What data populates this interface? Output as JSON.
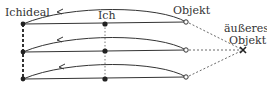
{
  "diagram": {
    "labels": {
      "ego_ideal": "Ichideal",
      "ego": "Ich",
      "object": "Objekt",
      "external_object_line1": "äußeres",
      "external_object_line2": "Objekt"
    },
    "rows": [
      {
        "ego_ideal_y": 24,
        "ego_y": 24,
        "object_y": 22
      },
      {
        "ego_ideal_y": 52,
        "ego_y": 51,
        "object_y": 50
      },
      {
        "ego_ideal_y": 79,
        "ego_y": 79,
        "object_y": 77
      }
    ],
    "colors": {
      "line": "#333333",
      "background": "#ffffff"
    }
  }
}
